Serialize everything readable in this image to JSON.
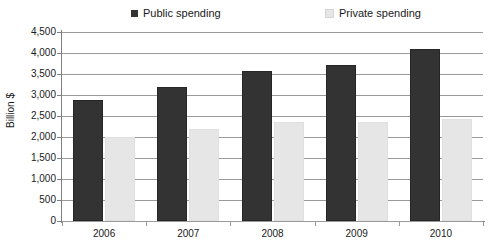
{
  "chart_data": {
    "type": "bar",
    "title": "",
    "subtitle": "",
    "xlabel": "",
    "ylabel": "Billion $",
    "categories": [
      "2006",
      "2007",
      "2008",
      "2009",
      "2010"
    ],
    "series": [
      {
        "name": "Public spending",
        "color": "#333333",
        "values": [
          2880,
          3200,
          3580,
          3720,
          4100
        ]
      },
      {
        "name": "Private spending",
        "color": "#e6e6e6",
        "values": [
          2000,
          2200,
          2350,
          2350,
          2420
        ]
      }
    ],
    "ylim": [
      0,
      4500
    ],
    "ytick_step": 500,
    "ytick_labels": [
      "4,500",
      "4,000",
      "3,500",
      "3,000",
      "2,500",
      "2,000",
      "1,500",
      "1,000",
      "500",
      "0"
    ],
    "ytick_values": [
      4500,
      4000,
      3500,
      3000,
      2500,
      2000,
      1500,
      1000,
      500,
      0
    ],
    "grid": true,
    "grid_axis": "y",
    "legend_position": "top",
    "legend": [
      {
        "label": "Public spending",
        "marker": "legend-swatch-public",
        "color": "#333333"
      },
      {
        "label": "Private spending",
        "marker": "legend-swatch-private",
        "color": "#e6e6e6"
      }
    ]
  },
  "colors": {
    "public": "#333333",
    "private": "#e6e6e6",
    "grid": "#9a9a9a",
    "axis": "#808080",
    "text": "#1a1a1a",
    "background": "#ffffff"
  }
}
